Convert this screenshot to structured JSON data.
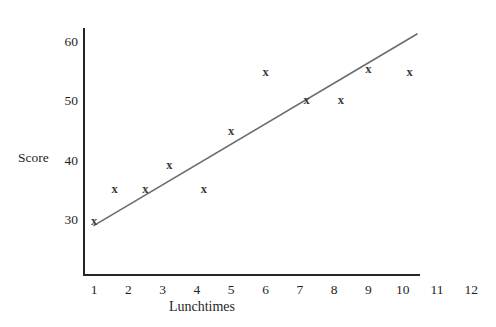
{
  "chart_data": {
    "type": "scatter",
    "title": "",
    "xlabel": "Lunchtimes",
    "ylabel": "Score",
    "xlim": [
      0.5,
      12.4
    ],
    "ylim": [
      24,
      63
    ],
    "grid": false,
    "legend": null,
    "x_ticks": [
      "1",
      "2",
      "3",
      "4",
      "5",
      "6",
      "7",
      "8",
      "9",
      "10",
      "11",
      "12"
    ],
    "x_tick_values": [
      1,
      2,
      3,
      4,
      5,
      6,
      7,
      8,
      9,
      10,
      11,
      12
    ],
    "y_ticks": [
      "30",
      "40",
      "50",
      "60"
    ],
    "y_tick_values": [
      30,
      40,
      50,
      60
    ],
    "marker_glyph": "x",
    "marker_color": "#3a3a3a",
    "axis_color": "#262626",
    "trendline_color": "#6b6b70",
    "points": [
      {
        "x": 1.0,
        "y": 29.8
      },
      {
        "x": 1.6,
        "y": 35.2
      },
      {
        "x": 2.5,
        "y": 35.2
      },
      {
        "x": 3.2,
        "y": 39.2
      },
      {
        "x": 4.2,
        "y": 35.3
      },
      {
        "x": 5.0,
        "y": 45.0
      },
      {
        "x": 6.0,
        "y": 55.0
      },
      {
        "x": 7.2,
        "y": 50.2
      },
      {
        "x": 8.2,
        "y": 50.3
      },
      {
        "x": 9.0,
        "y": 55.5
      },
      {
        "x": 10.2,
        "y": 55.0
      }
    ],
    "trendline": {
      "x_start": 0.98,
      "y_start": 29.0,
      "x_end": 10.43,
      "y_end": 61.4
    }
  }
}
